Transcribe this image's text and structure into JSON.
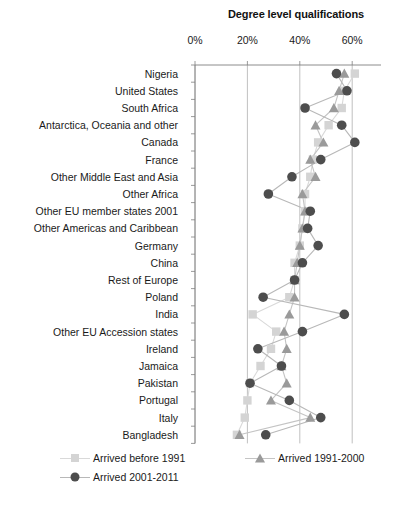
{
  "chart_data": {
    "type": "line",
    "title": "Degree level qualifications",
    "xlabel": "",
    "ylabel": "",
    "xlim": [
      0,
      70
    ],
    "xticks": [
      0,
      20,
      40,
      60
    ],
    "xtick_labels": [
      "0%",
      "20%",
      "40%",
      "60%"
    ],
    "grid": "vertical-gridlines-at-xticks",
    "legend_position": "bottom-left",
    "orientation": "horizontal-categories-on-y-axis",
    "categories": [
      "Nigeria",
      "United States",
      "South Africa",
      "Antarctica, Oceania and other",
      "Canada",
      "France",
      "Other Middle East and Asia",
      "Other Africa",
      "Other EU member states 2001",
      "Other Americas and Caribbean",
      "Germany",
      "China",
      "Rest of Europe",
      "Poland",
      "India",
      "Other EU Accession states",
      "Ireland",
      "Jamaica",
      "Pakistan",
      "Portugal",
      "Italy",
      "Bangladesh"
    ],
    "series": [
      {
        "name": "Arrived before 1991",
        "marker": "square",
        "color": "#d4d4d4",
        "line_color": "#d9d9d9",
        "values": [
          61,
          57,
          56,
          51,
          47,
          45,
          44,
          42,
          42,
          41,
          40,
          38,
          38,
          36,
          22,
          31,
          29,
          25,
          21,
          20,
          19,
          16
        ]
      },
      {
        "name": "Arrived 1991-2000",
        "marker": "triangle",
        "color": "#9a9a9a",
        "line_color": "#c4c4c4",
        "values": [
          57,
          55,
          53,
          46,
          49,
          44,
          46,
          41,
          42,
          41,
          40,
          39,
          38,
          38,
          36,
          34,
          35,
          33,
          35,
          29,
          44,
          17
        ]
      },
      {
        "name": "Arrived 2001-2011",
        "marker": "circle",
        "color": "#4d4d4d",
        "line_color": "#b8b8b8",
        "values": [
          54,
          58,
          42,
          56,
          61,
          48,
          37,
          28,
          44,
          43,
          47,
          41,
          38,
          26,
          57,
          41,
          24,
          33,
          21,
          36,
          48,
          27
        ]
      }
    ]
  },
  "legend": {
    "items": [
      {
        "label": "Arrived before 1991",
        "marker": "square-marker"
      },
      {
        "label": "Arrived 1991-2000",
        "marker": "triangle-marker"
      },
      {
        "label": "Arrived 2001-2011",
        "marker": "circle-marker"
      }
    ]
  },
  "colors": {
    "series_before_1991": "#d4d4d4",
    "series_1991_2000": "#9a9a9a",
    "series_2001_2011": "#4d4d4d",
    "gridline": "#b0b0b0",
    "axis": "#808080",
    "text": "#1a1a1a"
  }
}
